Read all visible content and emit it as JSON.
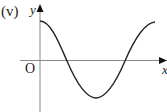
{
  "diagram": {
    "part_label": "(v)",
    "y_axis_label": "y",
    "x_axis_label": "x",
    "origin_label": "O",
    "curve": "cosine-like wave starting at maximum on y-axis, crossing x-axis, reaching minimum, and rising back to maximum"
  }
}
